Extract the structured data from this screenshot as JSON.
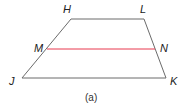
{
  "figure": {
    "caption": "(a)",
    "shape": "trapezoid",
    "colors": {
      "edge": "#6b6b6b",
      "midsegment": "#e8384f",
      "text": "#222222"
    },
    "vertices": {
      "H": {
        "label": "H",
        "x": 71,
        "y": 19
      },
      "L": {
        "label": "L",
        "x": 144,
        "y": 19
      },
      "K": {
        "label": "K",
        "x": 166,
        "y": 78
      },
      "J": {
        "label": "J",
        "x": 22,
        "y": 78
      }
    },
    "midpoints": {
      "M": {
        "label": "M",
        "x": 47,
        "y": 49
      },
      "N": {
        "label": "N",
        "x": 155,
        "y": 49
      }
    },
    "segments": [
      {
        "name": "HL",
        "from": "H",
        "to": "L"
      },
      {
        "name": "LK",
        "from": "L",
        "to": "K"
      },
      {
        "name": "KJ",
        "from": "K",
        "to": "J"
      },
      {
        "name": "JH",
        "from": "J",
        "to": "H"
      },
      {
        "name": "MN",
        "from": "M",
        "to": "N",
        "midsegment": true
      }
    ]
  }
}
